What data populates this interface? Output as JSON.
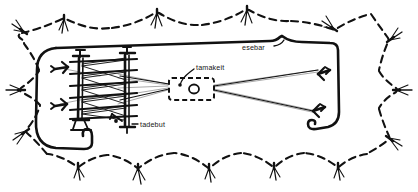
{
  "diagram": {
    "kind": "hand-drawn-sketch",
    "colors": {
      "ink": "#111111",
      "thread": "#9a9a9a",
      "background": "#ffffff"
    },
    "labels": [
      {
        "id": "esebar",
        "text": "esebar",
        "x": 246,
        "y": 49
      },
      {
        "id": "tamakeit",
        "text": "tamakeit",
        "x": 196,
        "y": 69
      },
      {
        "id": "tadebut",
        "text": "tadebut",
        "x": 141,
        "y": 127
      }
    ],
    "parts": {
      "rack": {
        "name": "warp rack",
        "posts": 2,
        "beams": 6
      },
      "box": {
        "name": "tamakeit box",
        "style": "dashed rectangle",
        "contents": [
          "dot",
          "small-circle"
        ]
      },
      "pegs": {
        "name": "forked stakes",
        "count": 4
      },
      "hook": {
        "name": "hook end",
        "count": 1
      },
      "border": {
        "name": "scalloped dashed border with plant marks",
        "plant_marks": 14
      }
    }
  }
}
